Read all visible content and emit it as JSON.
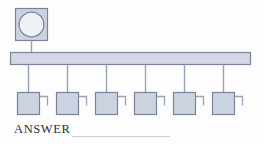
{
  "diagram": {
    "type": "network-topology",
    "server": {
      "name": "server-node",
      "shape": "square-with-circle",
      "x": 15,
      "y": 8,
      "size": 32,
      "circle_radius": 12
    },
    "bus": {
      "name": "network-bus",
      "shape": "horizontal-bar",
      "x": 10,
      "y": 52,
      "width": 240,
      "height": 12
    },
    "drop_from_server": {
      "from_y": 40,
      "to_y": 52,
      "x": 31
    },
    "nodes": [
      {
        "label": "",
        "x": 17,
        "y": 92
      },
      {
        "label": "",
        "x": 56,
        "y": 92
      },
      {
        "label": "",
        "x": 95,
        "y": 92
      },
      {
        "label": "",
        "x": 134,
        "y": 92
      },
      {
        "label": "",
        "x": 173,
        "y": 92
      },
      {
        "label": "",
        "x": 212,
        "y": 92
      }
    ],
    "node_size": 22,
    "node_tab": {
      "width": 8,
      "height": 9,
      "offset_y": 4
    },
    "colors": {
      "fill_node": "#ccd3e0",
      "fill_bar": "#d2d8e4",
      "fill_circle": "#eef1f7",
      "fill_server_box": "#ccd3e0",
      "stroke": "#7b839b",
      "stroke_light": "#9aa2b8",
      "connector": "#9aa2b8",
      "text": "#2b2f3a",
      "rule": "#c9ccd6",
      "background": "#fdfdfd"
    }
  },
  "answer": {
    "label": "ANSWER"
  }
}
